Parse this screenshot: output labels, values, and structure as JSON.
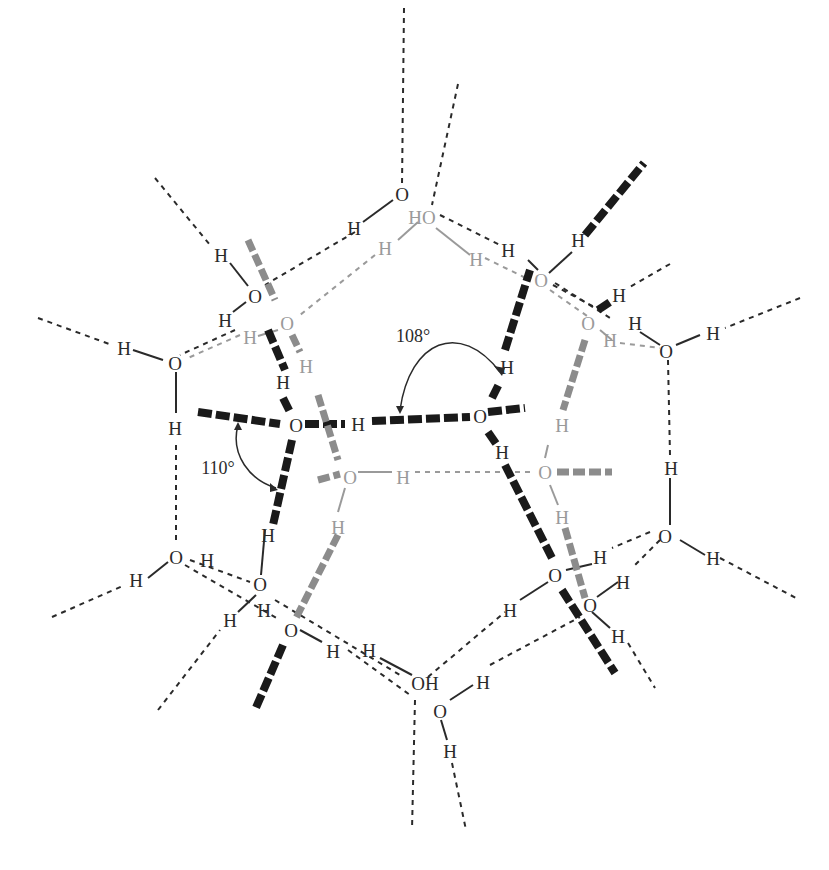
{
  "diagram": {
    "type": "water hydrogen-bond network (pentagonal ring structure)",
    "atoms": {
      "oxygen": "O",
      "hydrogen": "H",
      "oh_label": "OH",
      "ho_label": "HO"
    },
    "angles": [
      {
        "label": "108°",
        "x": 413,
        "y": 336
      },
      {
        "label": "110°",
        "x": 218,
        "y": 468
      }
    ],
    "colors": {
      "foreground": "#2a2a2a",
      "background_layer": "#9a9a9a",
      "wedge_front": "#1a1a1a",
      "wedge_back": "#8c8c8c",
      "page": "#ffffff"
    }
  }
}
